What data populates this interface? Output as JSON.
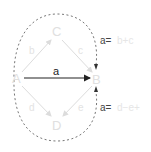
{
  "diagram": {
    "nodes": {
      "A": {
        "label": "A"
      },
      "B": {
        "label": "B"
      },
      "C": {
        "label": "C"
      },
      "D": {
        "label": "D"
      }
    },
    "edges": {
      "a": {
        "label": "a",
        "from": "A",
        "to": "B"
      },
      "b": {
        "label": "b",
        "from": "A",
        "to": "C"
      },
      "c": {
        "label": "c",
        "from": "C",
        "to": "B"
      },
      "d": {
        "label": "d",
        "from": "A",
        "to": "D"
      },
      "e": {
        "label": "e",
        "from": "D",
        "to": "B"
      }
    },
    "equations": {
      "top": {
        "lhs": "a=",
        "rhs": "b+c"
      },
      "bottom": {
        "lhs": "a=",
        "rhs": "d−e+"
      }
    },
    "colors": {
      "main_arrow": "#222222",
      "faded": "#e0e0e0",
      "dashed_loop": "#666666"
    }
  }
}
